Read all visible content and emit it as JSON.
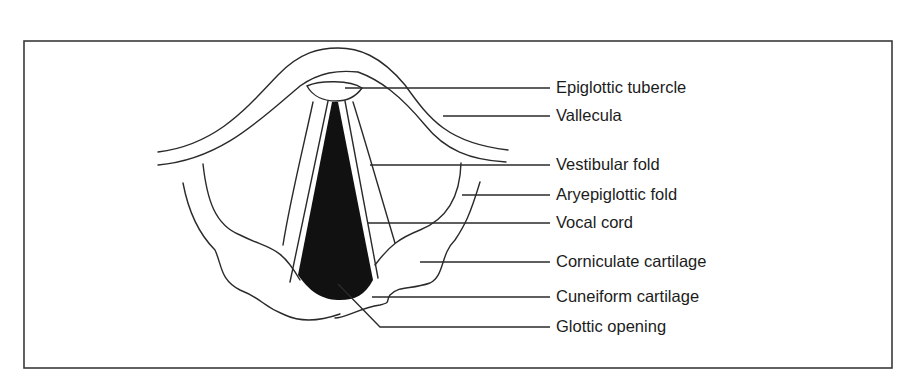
{
  "diagram": {
    "type": "anatomical-line-drawing",
    "colors": {
      "line": "#2a2a2a",
      "glottis_fill": "#111111",
      "border": "#3a3a3a",
      "background": "#ffffff"
    },
    "labels": [
      {
        "id": "epiglottic-tubercle",
        "text": "Epiglottic tubercle"
      },
      {
        "id": "vallecula",
        "text": "Vallecula"
      },
      {
        "id": "vestibular-fold",
        "text": "Vestibular fold"
      },
      {
        "id": "aryepiglottic-fold",
        "text": "Aryepiglottic fold"
      },
      {
        "id": "vocal-cord",
        "text": "Vocal cord"
      },
      {
        "id": "corniculate-cartilage",
        "text": "Corniculate cartilage"
      },
      {
        "id": "cuneiform-cartilage",
        "text": "Cuneiform cartilage"
      },
      {
        "id": "glottic-opening",
        "text": "Glottic opening"
      }
    ]
  }
}
